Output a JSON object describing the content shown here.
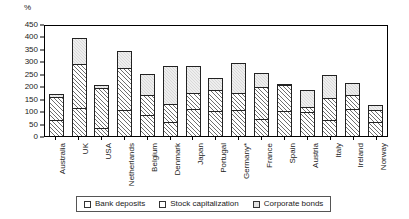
{
  "chart_data": {
    "type": "bar",
    "stacked": true,
    "title": "",
    "subtitle": "",
    "xlabel": "",
    "ylabel": "%",
    "unit_label": "%",
    "ylim": [
      0,
      450
    ],
    "ytick_step": 50,
    "yticks": [
      450,
      400,
      350,
      300,
      250,
      200,
      150,
      100,
      50,
      0
    ],
    "grid": false,
    "legend_position": "bottom",
    "categories": [
      "Australia",
      "UK",
      "USA",
      "Netherlands",
      "Belgium",
      "Denmark",
      "Japan",
      "Portugal",
      "Germany*",
      "France",
      "Spain",
      "Austria",
      "Italy",
      "Ireland",
      "Norway"
    ],
    "series": [
      {
        "name": "Bank deposits",
        "pattern": "hatch",
        "values": [
          60,
          110,
          28,
          100,
          82,
          52,
          105,
          100,
          100,
          65,
          100,
          95,
          60,
          105,
          55
        ]
      },
      {
        "name": "Stock capitalization",
        "pattern": "hatch",
        "values": [
          95,
          180,
          165,
          172,
          83,
          73,
          67,
          85,
          72,
          130,
          107,
          20,
          90,
          60,
          50
        ]
      },
      {
        "name": "Corporate bonds",
        "pattern": "light-dotted",
        "values": [
          15,
          105,
          12,
          70,
          85,
          155,
          110,
          47,
          120,
          57,
          3,
          70,
          95,
          50,
          20
        ]
      }
    ],
    "totals": [
      170,
      395,
      205,
      342,
      250,
      280,
      282,
      232,
      292,
      252,
      210,
      185,
      245,
      215,
      125
    ],
    "annotations": [
      "Germany*"
    ]
  },
  "legend": {
    "items": [
      {
        "label": "Bank deposits",
        "icon": "legend-swatch-hatch"
      },
      {
        "label": "Stock capitalization",
        "icon": "legend-swatch-hatch"
      },
      {
        "label": "Corporate bonds",
        "icon": "legend-swatch-light"
      }
    ]
  }
}
